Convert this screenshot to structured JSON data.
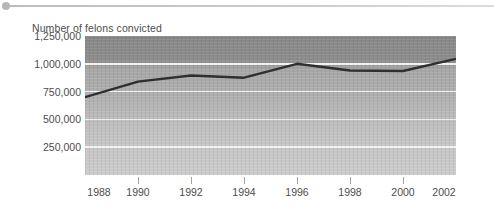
{
  "decoration": {
    "bullet_icon": "bullet-dot-icon",
    "rule_icon": "horizontal-rule-icon"
  },
  "chart_data": {
    "type": "line",
    "title": "Number of felons convicted",
    "xlabel": "",
    "ylabel": "",
    "x": [
      1988,
      1990,
      1992,
      1994,
      1996,
      1998,
      2000,
      2002
    ],
    "categories": [
      "1988",
      "1990",
      "1992",
      "1994",
      "1996",
      "1998",
      "2000",
      "2002"
    ],
    "values": [
      700000,
      840000,
      895000,
      875000,
      1000000,
      940000,
      935000,
      1045000
    ],
    "series": [
      {
        "name": "Number of felons convicted",
        "values": [
          700000,
          840000,
          895000,
          875000,
          1000000,
          940000,
          935000,
          1045000
        ]
      }
    ],
    "ylim": [
      0,
      1250000
    ],
    "xlim": [
      1988,
      2002
    ],
    "yticks": [
      250000,
      500000,
      750000,
      1000000,
      1250000
    ],
    "ytick_labels": [
      "250,000",
      "500,000",
      "750,000",
      "1,000,000",
      "1,250,000"
    ],
    "xticks": [
      1988,
      1990,
      1992,
      1994,
      1996,
      1998,
      2000,
      2002
    ],
    "xtick_labels": [
      "1988",
      "1990",
      "1992",
      "1994",
      "1996",
      "1998",
      "2000",
      "2002"
    ],
    "grid": "horizontal",
    "legend": "none",
    "line_color": "#2f2f2f",
    "gridline_color": "#f3f3f3",
    "plot_bg_top_color": "#878787",
    "plot_bg_bottom_color": "#cbcbcb"
  }
}
